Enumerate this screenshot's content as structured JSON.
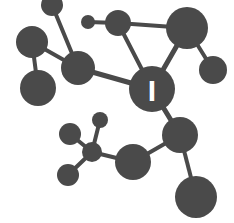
{
  "figure": {
    "width": 234,
    "height": 223,
    "background_color": "#ffffff",
    "node_color": "#4a4a4a",
    "edge_color": "#4a4a4a",
    "label_color": "#ffffff"
  },
  "chart_data": {
    "type": "scatter",
    "xlabel": "",
    "ylabel": "",
    "xlim": [
      0,
      234
    ],
    "ylim": [
      0,
      223
    ],
    "grid": false,
    "legend": "none",
    "nodes": [
      {
        "id": "n1",
        "label": "",
        "x": 52,
        "y": 5,
        "r": 11,
        "size": "small"
      },
      {
        "id": "n2",
        "label": "",
        "x": 88,
        "y": 22,
        "r": 7,
        "size": "tiny"
      },
      {
        "id": "n3",
        "label": "",
        "x": 118,
        "y": 23,
        "r": 13,
        "size": "medium"
      },
      {
        "id": "n4",
        "label": "",
        "x": 187,
        "y": 28,
        "r": 21,
        "size": "large"
      },
      {
        "id": "n5",
        "label": "",
        "x": 32,
        "y": 42,
        "r": 16,
        "size": "medium"
      },
      {
        "id": "n6",
        "label": "",
        "x": 78,
        "y": 68,
        "r": 17,
        "size": "medium"
      },
      {
        "id": "n7",
        "label": "",
        "x": 213,
        "y": 70,
        "r": 14,
        "size": "medium"
      },
      {
        "id": "n8",
        "label": "",
        "x": 38,
        "y": 88,
        "r": 18,
        "size": "large"
      },
      {
        "id": "n9",
        "label": "I",
        "x": 152,
        "y": 89,
        "r": 23,
        "size": "hub"
      },
      {
        "id": "n10",
        "label": "",
        "x": 100,
        "y": 120,
        "r": 8,
        "size": "small"
      },
      {
        "id": "n11",
        "label": "",
        "x": 70,
        "y": 134,
        "r": 11,
        "size": "small"
      },
      {
        "id": "n12",
        "label": "",
        "x": 180,
        "y": 135,
        "r": 18,
        "size": "large"
      },
      {
        "id": "n13",
        "label": "",
        "x": 92,
        "y": 152,
        "r": 10,
        "size": "small"
      },
      {
        "id": "n14",
        "label": "",
        "x": 133,
        "y": 162,
        "r": 18,
        "size": "large"
      },
      {
        "id": "n15",
        "label": "",
        "x": 68,
        "y": 175,
        "r": 11,
        "size": "small"
      },
      {
        "id": "n16",
        "label": "",
        "x": 196,
        "y": 197,
        "r": 21,
        "size": "large"
      }
    ],
    "edges": [
      {
        "source": "n1",
        "target": "n6",
        "width": 4
      },
      {
        "source": "n2",
        "target": "n3",
        "width": 4
      },
      {
        "source": "n3",
        "target": "n4",
        "width": 4
      },
      {
        "source": "n3",
        "target": "n9",
        "width": 4
      },
      {
        "source": "n5",
        "target": "n6",
        "width": 4
      },
      {
        "source": "n5",
        "target": "n8",
        "width": 4
      },
      {
        "source": "n6",
        "target": "n9",
        "width": 5
      },
      {
        "source": "n4",
        "target": "n7",
        "width": 4
      },
      {
        "source": "n4",
        "target": "n9",
        "width": 5
      },
      {
        "source": "n9",
        "target": "n12",
        "width": 5
      },
      {
        "source": "n10",
        "target": "n13",
        "width": 4
      },
      {
        "source": "n11",
        "target": "n13",
        "width": 4
      },
      {
        "source": "n13",
        "target": "n14",
        "width": 4
      },
      {
        "source": "n13",
        "target": "n15",
        "width": 4
      },
      {
        "source": "n12",
        "target": "n14",
        "width": 4
      },
      {
        "source": "n12",
        "target": "n16",
        "width": 4
      }
    ],
    "labels": [
      {
        "node": "n9",
        "text": "I",
        "color": "#ffffff",
        "font_size": 30
      }
    ]
  }
}
